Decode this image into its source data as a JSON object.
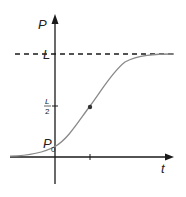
{
  "diagram": {
    "y_axis_label": "P",
    "x_axis_label": "t",
    "asymptote_label": "L",
    "half_label_num": "L",
    "half_label_den": "2",
    "initial_label": "P",
    "initial_subscript": "0",
    "colors": {
      "axes": "#1a1a1a",
      "curve": "#8a8a8a",
      "dashed": "#1a1a1a",
      "point": "#333333"
    }
  }
}
